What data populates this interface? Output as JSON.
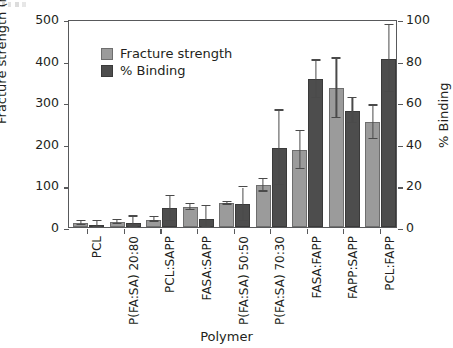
{
  "chart_data": {
    "type": "bar",
    "title": "",
    "xlabel": "Polymer",
    "ylabel": "Fracture strength (mN/cm2)",
    "y2label": "% Binding",
    "ylim": [
      0,
      500
    ],
    "y2lim": [
      0,
      100
    ],
    "yticks": [
      "0",
      "100",
      "200",
      "300",
      "400",
      "500"
    ],
    "y2ticks": [
      "0",
      "20",
      "40",
      "60",
      "80",
      "100"
    ],
    "grid": false,
    "legend_position": "upper left",
    "categories": [
      "PCL",
      "P(FA:SA) 20:80",
      "PCL:SAPP",
      "FASA:SAPP",
      "P(FA:SA) 50:50",
      "P(FA:SA) 70:30",
      "FASA:FAPP",
      "FAPP:SAPP",
      "PCL:FAPP"
    ],
    "series": [
      {
        "name": "Fracture strength",
        "axis": "left",
        "units": "mN/cm2",
        "color": "#9b9b9b",
        "values": [
          10,
          12,
          18,
          48,
          57,
          100,
          185,
          333,
          252
        ],
        "errors": [
          5,
          4,
          5,
          8,
          3,
          15,
          45,
          72,
          40
        ]
      },
      {
        "name": "% Binding",
        "axis": "right",
        "units": "%",
        "color": "#4d4d4d",
        "values": [
          1,
          2,
          9,
          4,
          11,
          38,
          71,
          56,
          81
        ],
        "errors": [
          2,
          3,
          6,
          6,
          8,
          18,
          9,
          6,
          16
        ]
      }
    ]
  },
  "legend": {
    "items": [
      {
        "label": "Fracture strength"
      },
      {
        "label": "% Binding"
      }
    ]
  },
  "axis_titles": {
    "y_left_prefix": "Fracture strength (mN/cm",
    "y_left_sup": "2",
    "y_left_suffix": ")",
    "y_right": "% Binding",
    "x": "Polymer"
  },
  "colors": {
    "fracture_strength": "#9b9b9b",
    "binding": "#4d4d4d",
    "axis": "#58595b",
    "text": "#231f20",
    "background": "#ffffff"
  }
}
